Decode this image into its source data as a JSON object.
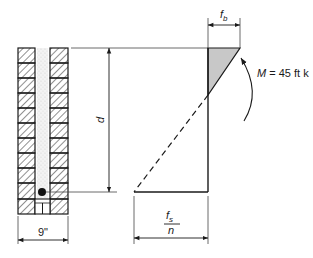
{
  "diagram": {
    "type": "reinforced masonry wall section with stress distribution",
    "labels": {
      "depth": "d",
      "wall_thickness": "9\"",
      "compressive_stress": "f",
      "compressive_stress_sub": "b",
      "steel_stress_num": "f",
      "steel_stress_num_sub": "s",
      "steel_stress_den": "n",
      "moment_symbol": "M",
      "moment_value": " = 45 ft k"
    },
    "colors": {
      "line": "#1a1a1a",
      "compression_fill": "#c8c8c8",
      "grout_fill": "#eeeeee"
    }
  }
}
